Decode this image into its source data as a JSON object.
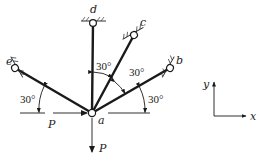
{
  "figure": {
    "joint": {
      "label": "a",
      "x": 92,
      "y": 113
    },
    "supports": [
      {
        "id": "b",
        "label": "b",
        "x": 170,
        "y": 68,
        "angle_from_horizontal_deg": 30
      },
      {
        "id": "c",
        "label": "c",
        "x": 134,
        "y": 35,
        "angle_from_horizontal_deg": 60
      },
      {
        "id": "d",
        "label": "d",
        "x": 93,
        "y": 23,
        "angle_from_horizontal_deg": 90
      },
      {
        "id": "e",
        "label": "e",
        "x": 15,
        "y": 68,
        "angle_from_horizontal_deg": 150
      }
    ],
    "angle_labels": {
      "d_c": "30°",
      "c_b": "30°",
      "b_horizontal": "30°",
      "e_horizontal": "30°"
    },
    "loads": {
      "horizontal": {
        "label": "P",
        "direction": "right"
      },
      "vertical": {
        "label": "P",
        "direction": "down"
      }
    },
    "axes": {
      "x_label": "x",
      "y_label": "y"
    },
    "colors": {
      "line": "#1a1a1a",
      "background": "#ffffff"
    }
  }
}
